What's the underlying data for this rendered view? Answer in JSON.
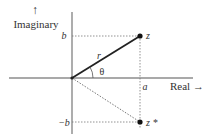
{
  "diagram": {
    "axes": {
      "vertical_label": "Imaginary",
      "vertical_arrow": "↑",
      "horizontal_label": "Real →"
    },
    "labels": {
      "b": "b",
      "neg_b": "−b",
      "a": "a",
      "r": "r",
      "theta": "θ",
      "z": "z",
      "z_conj": "z *"
    },
    "colors": {
      "axis": "#8a8a8a",
      "vector": "#222222",
      "dotted": "#777777",
      "point": "#111111",
      "text": "#333333"
    }
  }
}
